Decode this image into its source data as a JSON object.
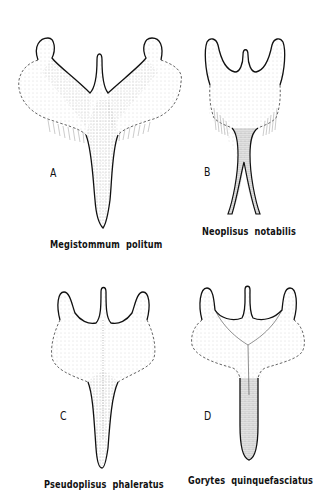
{
  "figure": {
    "panels": [
      {
        "letter": "A",
        "caption": "Megistommum  politum"
      },
      {
        "letter": "B",
        "caption": "Neoplisus  notabilis"
      },
      {
        "letter": "C",
        "caption": "Pseudoplisus  phaleratus"
      },
      {
        "letter": "D",
        "caption": "Gorytes  quinquefasciatus"
      }
    ],
    "colors": {
      "ink": "#111111",
      "background": "#ffffff",
      "stipple": "#777777"
    }
  }
}
